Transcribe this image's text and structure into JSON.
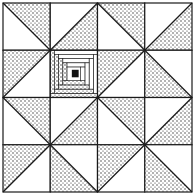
{
  "colors": {
    "line": "#1a1a1a",
    "background": "#ffffff",
    "stipple": "#2a2a2a",
    "center": "#111111"
  },
  "grid": {
    "rows": 4,
    "cols": 4,
    "origin": 3,
    "cell": 47.25
  },
  "cells": [
    [
      {
        "type": "tri",
        "diag": "tlbr",
        "shade": "tr"
      },
      {
        "type": "tri",
        "diag": "bltr",
        "shade": "br"
      },
      {
        "type": "tri",
        "diag": "tlbr",
        "shade": "tr"
      },
      {
        "type": "tri",
        "diag": "bltr",
        "shade": "br"
      }
    ],
    [
      {
        "type": "tri",
        "diag": "bltr",
        "shade": "tl"
      },
      {
        "type": "logcabin"
      },
      {
        "type": "tri",
        "diag": "bltr",
        "shade": "tl"
      },
      {
        "type": "tri",
        "diag": "tlbr",
        "shade": "bl"
      }
    ],
    [
      {
        "type": "tri",
        "diag": "tlbr",
        "shade": "tr"
      },
      {
        "type": "tri",
        "diag": "bltr",
        "shade": "br"
      },
      {
        "type": "tri",
        "diag": "tlbr",
        "shade": "tr"
      },
      {
        "type": "tri",
        "diag": "bltr",
        "shade": "br"
      }
    ],
    [
      {
        "type": "tri",
        "diag": "bltr",
        "shade": "tl"
      },
      {
        "type": "tri",
        "diag": "tlbr",
        "shade": "bl"
      },
      {
        "type": "tri",
        "diag": "bltr",
        "shade": "tl"
      },
      {
        "type": "tri",
        "diag": "tlbr",
        "shade": "bl"
      }
    ]
  ]
}
